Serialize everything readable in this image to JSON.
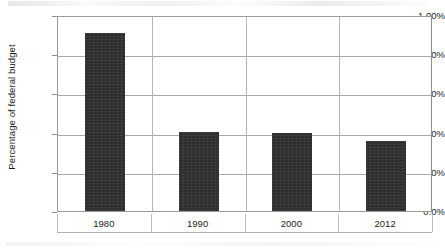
{
  "chart_data": {
    "type": "bar",
    "title": "",
    "xlabel": "",
    "ylabel": "Percentage of federal budget",
    "categories": [
      "1980",
      "1990",
      "2000",
      "2012"
    ],
    "values": [
      0.91,
      0.405,
      0.4,
      0.355
    ],
    "value_labels": [
      "0.91%",
      "0.405%",
      "0.40%",
      "0.355%"
    ],
    "ylim": [
      0,
      1.0
    ],
    "ytick_values": [
      1.0,
      0.8,
      0.6,
      0.4,
      0.2,
      0.0
    ],
    "ytick_labels": [
      "1.00%",
      "0.80%",
      "0.60%",
      "0.40%",
      "0.20%",
      "0.0%"
    ],
    "grid": true,
    "legend": false,
    "legend_position": "none",
    "series": [
      {
        "name": "Percentage of federal budget",
        "values": [
          0.91,
          0.405,
          0.4,
          0.355
        ]
      }
    ],
    "colors": {
      "bar_fill": "#2e2e2e",
      "gridline": "#a8a8a8",
      "axis_line": "#9a9a9a",
      "plot_background": "#ffffff",
      "text": "#1c1c1c"
    }
  }
}
